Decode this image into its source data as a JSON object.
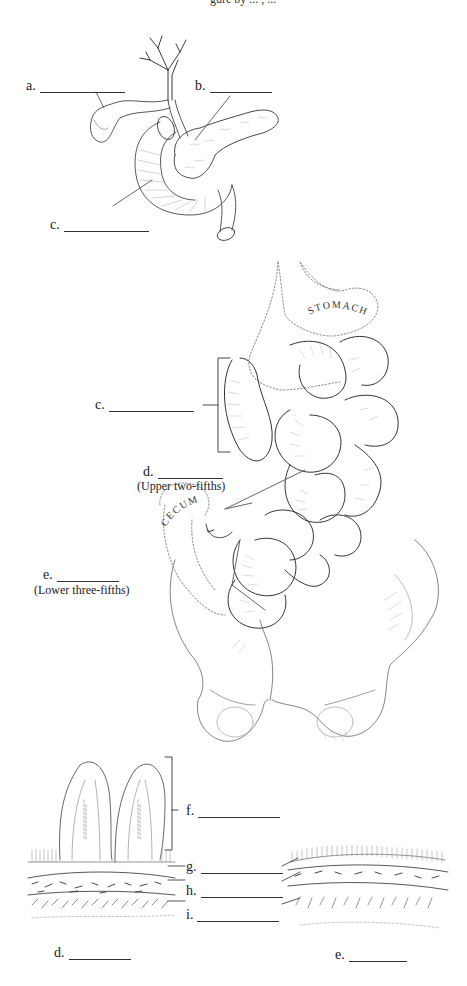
{
  "header": {
    "text": "gure by ... , ..."
  },
  "figure_top": {
    "labels": [
      {
        "id": "a",
        "text": "a.",
        "blank_width": 85
      },
      {
        "id": "b",
        "text": "b.",
        "blank_width": 62
      },
      {
        "id": "c",
        "text": "c.",
        "blank_width": 85
      }
    ]
  },
  "figure_middle": {
    "organ_labels": {
      "stomach": "STOMACH",
      "cecum": "CECUM"
    },
    "labels": [
      {
        "id": "c",
        "text": "c.",
        "blank_width": 85
      },
      {
        "id": "d",
        "text": "d.",
        "blank_width": 65,
        "note": "(Upper two-fifths)"
      },
      {
        "id": "e",
        "text": "e.",
        "blank_width": 62,
        "note": "(Lower three-fifths)"
      }
    ]
  },
  "figure_bottom": {
    "labels": [
      {
        "id": "f",
        "text": "f.",
        "blank_width": 82
      },
      {
        "id": "g",
        "text": "g.",
        "blank_width": 82
      },
      {
        "id": "h",
        "text": "h.",
        "blank_width": 82
      },
      {
        "id": "i",
        "text": "i.",
        "blank_width": 82
      }
    ],
    "captions": [
      {
        "id": "d",
        "text": "d.",
        "blank_width": 62
      },
      {
        "id": "e",
        "text": "e.",
        "blank_width": 58
      }
    ]
  },
  "colors": {
    "ink": "#1a1a1a",
    "line": "#444444",
    "faint": "#9a9a9a",
    "background": "#ffffff"
  }
}
